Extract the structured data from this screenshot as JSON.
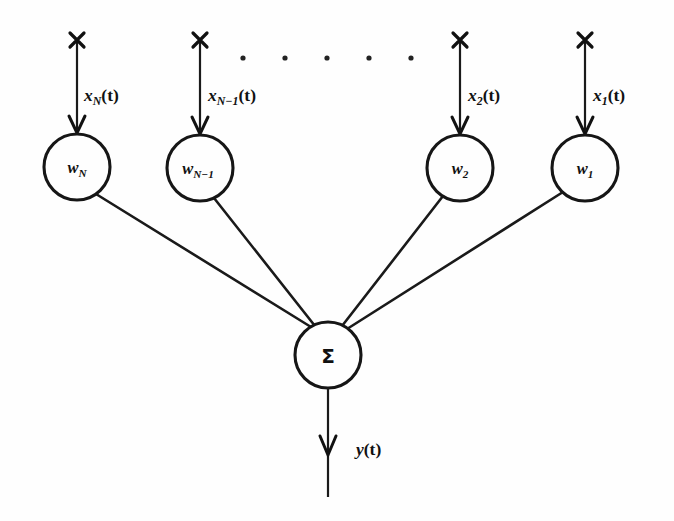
{
  "figure": {
    "background_color": "#fefefe",
    "ink_color": "#1a1a1a",
    "width": 674,
    "height": 521
  },
  "inputs": [
    {
      "id": "input-N",
      "label_var": "x",
      "label_sub": "N",
      "label_arg": "(t)",
      "label_full": "x_N(t)",
      "x": 77,
      "label_x": 84,
      "label_y": 101
    },
    {
      "id": "input-N-minus-1",
      "label_var": "x",
      "label_sub": "N−1",
      "label_arg": "(t)",
      "label_full": "x_{N-1}(t)",
      "x": 200,
      "label_x": 208,
      "label_y": 101
    },
    {
      "id": "input-2",
      "label_var": "x",
      "label_sub": "2",
      "label_arg": "(t)",
      "label_full": "x_2(t)",
      "x": 460,
      "label_x": 468,
      "label_y": 101
    },
    {
      "id": "input-1",
      "label_var": "x",
      "label_sub": "1",
      "label_arg": "(t)",
      "label_full": "x_1(t)",
      "x": 585,
      "label_x": 593,
      "label_y": 101
    }
  ],
  "weight_nodes": [
    {
      "id": "weight-node-N",
      "label_var": "w",
      "label_sub": "N",
      "label_full": "w_N",
      "cx": 77,
      "cy": 167,
      "r": 33
    },
    {
      "id": "weight-node-N-minus-1",
      "label_var": "w",
      "label_sub": "N−1",
      "label_full": "w_{N-1}",
      "cx": 200,
      "cy": 168,
      "r": 33
    },
    {
      "id": "weight-node-2",
      "label_var": "w",
      "label_sub": "2",
      "label_full": "w_2",
      "cx": 460,
      "cy": 168,
      "r": 33
    },
    {
      "id": "weight-node-1",
      "label_var": "w",
      "label_sub": "1",
      "label_full": "w_1",
      "cx": 585,
      "cy": 168,
      "r": 33
    }
  ],
  "summation_node": {
    "id": "summation-node",
    "label": "Σ",
    "cx": 328,
    "cy": 355,
    "r": 33
  },
  "output": {
    "id": "output-signal",
    "label_var": "y",
    "label_arg": "(t)",
    "label_full": "y(t)",
    "label_x": 356,
    "label_y": 455,
    "line_x": 328,
    "line_top": 388,
    "line_bottom": 497,
    "arrow_y": 452
  },
  "ellipsis": {
    "id": "ellipsis-dots",
    "count": 5,
    "y": 58,
    "x_positions": [
      243,
      285,
      327,
      369,
      411
    ],
    "radius": 2.6
  },
  "geometry": {
    "input_line_top": 36,
    "input_line_arrow_y": 131,
    "cross_mark_y": 40,
    "cross_mark_half": 7
  }
}
